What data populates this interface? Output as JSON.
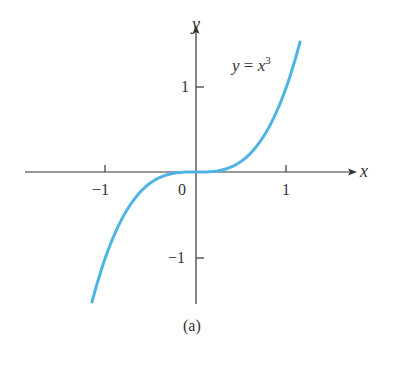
{
  "chart_data": {
    "type": "line",
    "title": "",
    "function_label": "y = x^3",
    "xlabel": "x",
    "ylabel": "y",
    "caption": "(a)",
    "x_ticks": [
      -1,
      0,
      1
    ],
    "y_ticks": [
      -1,
      1
    ],
    "x_tick_labels": [
      "−1",
      "0",
      "1"
    ],
    "y_tick_labels": [
      "1",
      "−1"
    ],
    "xlim": [
      -1.15,
      1.15
    ],
    "ylim": [
      -1.5,
      1.5
    ],
    "grid": false,
    "series": [
      {
        "name": "y = x^3",
        "color": "#4fb3e3",
        "x": [
          -1.15,
          -1.0,
          -0.75,
          -0.5,
          -0.25,
          0,
          0.25,
          0.5,
          0.75,
          1.0,
          1.15
        ],
        "y": [
          -1.521,
          -1.0,
          -0.422,
          -0.125,
          -0.016,
          0,
          0.016,
          0.125,
          0.422,
          1.0,
          1.521
        ]
      }
    ]
  },
  "labels": {
    "y_axis": "y",
    "x_axis": "x",
    "func_y": "y",
    "func_eq": " = ",
    "func_x": "x",
    "func_exp": "3",
    "tick_x_neg1": "−1",
    "tick_x_0": "0",
    "tick_x_1": "1",
    "tick_y_1": "1",
    "tick_y_neg1": "−1",
    "caption": "(a)"
  }
}
